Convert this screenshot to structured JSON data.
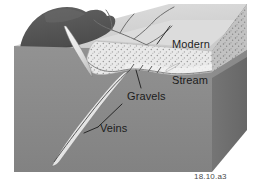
{
  "figure": {
    "caption_id": "18.10.a3",
    "labels": {
      "modern_stream_line1": "Modern",
      "modern_stream_line2": "Stream",
      "gravels": "Gravels",
      "veins": "Veins"
    },
    "colors": {
      "background": "#ffffff",
      "bedrock_front": "#8a8a8a",
      "bedrock_right": "#6e6e6e",
      "dark_hill": "#5a5a5a",
      "dark_hill_shadow": "#4d4d4d",
      "terrace_surface": "#d6d6d6",
      "gravel_light": "#e8e8e8",
      "gravel_right_face": "#bdbdbd",
      "vein_fill": "#f2f2f2",
      "stream_line": "#6b6b6b",
      "leader_line": "#1c1c1c",
      "label_text": "#1c1c1c",
      "caption_text": "#4a4a4a"
    }
  }
}
